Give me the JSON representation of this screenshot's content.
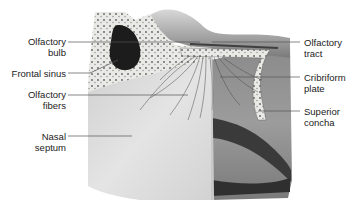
{
  "figure": {
    "labels_left": [
      {
        "id": "olfactory-bulb",
        "lines": [
          "Olfactory",
          "bulb"
        ]
      },
      {
        "id": "frontal-sinus",
        "lines": [
          "Frontal sinus"
        ]
      },
      {
        "id": "olfactory-fibers",
        "lines": [
          "Olfactory",
          "fibers"
        ]
      },
      {
        "id": "nasal-septum",
        "lines": [
          "Nasal",
          "septum"
        ]
      }
    ],
    "labels_right": [
      {
        "id": "olfactory-tract",
        "lines": [
          "Olfactory",
          "tract"
        ]
      },
      {
        "id": "cribriform-plate",
        "lines": [
          "Cribriform",
          "plate"
        ]
      },
      {
        "id": "superior-concha",
        "lines": [
          "Superior",
          "concha"
        ]
      }
    ]
  }
}
